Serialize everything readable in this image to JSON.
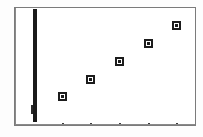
{
  "figure": {
    "title": "",
    "background": "#fdfdfd",
    "frame_color": "#7b7b7b",
    "marker_color": "#1c1c1c",
    "axis_bar_color": "#1a1a1a"
  },
  "chart_data": {
    "type": "scatter",
    "title": "",
    "xlabel": "",
    "ylabel": "",
    "xlim": [
      0,
      5
    ],
    "ylim": [
      0,
      5
    ],
    "grid": false,
    "legend": null,
    "x": [
      1,
      2,
      3,
      4,
      5
    ],
    "y": [
      1,
      2,
      3,
      4,
      5
    ],
    "series": [
      {
        "name": "series-1",
        "marker": "square",
        "points": [
          {
            "x": 1,
            "y": 1,
            "px": 61,
            "py": 95
          },
          {
            "x": 2,
            "y": 2,
            "px": 89,
            "py": 78
          },
          {
            "x": 3,
            "y": 3,
            "px": 118,
            "py": 60
          },
          {
            "x": 4,
            "y": 4,
            "px": 147,
            "py": 42
          },
          {
            "x": 5,
            "y": 5,
            "px": 175,
            "py": 24
          }
        ]
      }
    ],
    "xticks": [
      {
        "label": "",
        "px": 61
      },
      {
        "label": "",
        "px": 89
      },
      {
        "label": "",
        "px": 118
      },
      {
        "label": "",
        "px": 147
      },
      {
        "label": "",
        "px": 175
      }
    ],
    "yticks": [],
    "annotations": [
      {
        "name": "vertical-axis-bar",
        "description": "thick black vertical bar near left edge of plot",
        "px": 32,
        "width": 4,
        "top": 8,
        "bottom": 121
      }
    ]
  }
}
